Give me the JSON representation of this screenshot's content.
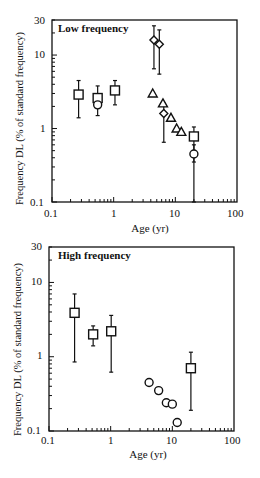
{
  "chart_data": [
    {
      "type": "scatter",
      "title": "Low frequency",
      "xlabel": "Age (yr)",
      "ylabel": "Frequency DL (% of standard frequency)",
      "xscale": "log",
      "yscale": "log",
      "xlim": [
        0.1,
        100
      ],
      "ylim": [
        0.1,
        30
      ],
      "xticks": [
        "0.1",
        "1",
        "10",
        "100"
      ],
      "yticks": [
        "0.1",
        "1",
        "10",
        "30"
      ],
      "grid": false,
      "series": [
        {
          "name": "squares",
          "marker": "square",
          "points": [
            {
              "x": 0.27,
              "y": 2.9,
              "lo": 1.4,
              "hi": 4.5
            },
            {
              "x": 0.55,
              "y": 2.6,
              "lo": 1.5,
              "hi": 3.8
            },
            {
              "x": 1.05,
              "y": 3.3,
              "lo": 2.1,
              "hi": 4.5
            },
            {
              "x": 20,
              "y": 0.78,
              "lo": 0.35,
              "hi": 1.05
            }
          ]
        },
        {
          "name": "circles",
          "marker": "circle",
          "points": [
            {
              "x": 0.55,
              "y": 2.1
            },
            {
              "x": 20,
              "y": 0.45,
              "lo": 0.1,
              "hi": 0.6
            }
          ]
        },
        {
          "name": "diamonds",
          "marker": "diamond",
          "points": [
            {
              "x": 4.5,
              "y": 16,
              "lo": 6.5,
              "hi": 25
            },
            {
              "x": 5.5,
              "y": 14,
              "lo": 5.5,
              "hi": 22
            },
            {
              "x": 6.5,
              "y": 1.6,
              "lo": 0.65,
              "hi": 2.2
            }
          ]
        },
        {
          "name": "triangles",
          "marker": "triangle",
          "points": [
            {
              "x": 4.3,
              "y": 3.0
            },
            {
              "x": 6.3,
              "y": 2.2
            },
            {
              "x": 8.5,
              "y": 1.4
            },
            {
              "x": 10.5,
              "y": 1.0
            },
            {
              "x": 12.5,
              "y": 0.9
            }
          ]
        }
      ]
    },
    {
      "type": "scatter",
      "title": "High frequency",
      "xlabel": "Age (yr)",
      "ylabel": "Frequency DL (% of standard frequency)",
      "xscale": "log",
      "yscale": "log",
      "xlim": [
        0.1,
        100
      ],
      "ylim": [
        0.1,
        30
      ],
      "xticks": [
        "0.1",
        "1",
        "10",
        "100"
      ],
      "yticks": [
        "0.1",
        "1",
        "10",
        "30"
      ],
      "grid": false,
      "series": [
        {
          "name": "squares",
          "marker": "square",
          "points": [
            {
              "x": 0.26,
              "y": 3.9,
              "lo": 0.85,
              "hi": 7
            },
            {
              "x": 0.52,
              "y": 2.0,
              "lo": 1.4,
              "hi": 2.6
            },
            {
              "x": 1.02,
              "y": 2.2,
              "lo": 0.62,
              "hi": 3.6
            },
            {
              "x": 20,
              "y": 0.7,
              "lo": 0.19,
              "hi": 1.15
            }
          ]
        },
        {
          "name": "circles",
          "marker": "circle",
          "points": [
            {
              "x": 4.2,
              "y": 0.45
            },
            {
              "x": 6,
              "y": 0.35
            },
            {
              "x": 8,
              "y": 0.24
            },
            {
              "x": 10,
              "y": 0.23
            },
            {
              "x": 12,
              "y": 0.13
            }
          ]
        }
      ]
    }
  ]
}
